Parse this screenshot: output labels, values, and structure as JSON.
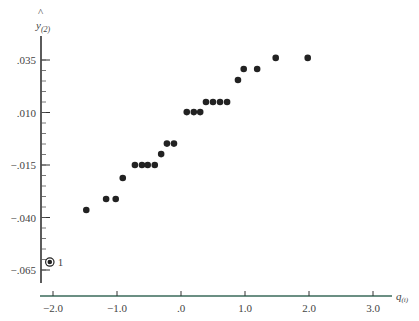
{
  "chart_data": {
    "type": "scatter",
    "title": "",
    "xlabel": "q(i)",
    "ylabel": "ŷ(2)",
    "xlim": [
      -2.2,
      3.3
    ],
    "ylim": [
      -0.069,
      0.043
    ],
    "grid": false,
    "legend": null,
    "x_ticks": [
      -2.0,
      -1.0,
      0.0,
      1.0,
      2.0,
      3.0
    ],
    "x_tick_labels": [
      "−2.0",
      "−1.0",
      ".0",
      "1.0",
      "2.0",
      "3.0"
    ],
    "y_ticks": [
      0.035,
      0.01,
      -0.015,
      -0.04,
      -0.065
    ],
    "y_tick_labels": [
      ".035",
      ".010",
      "−.015",
      "−.040",
      "−.065"
    ],
    "series": [
      {
        "name": "points",
        "x": [
          -1.48,
          -1.17,
          -1.02,
          -0.91,
          -0.72,
          -0.61,
          -0.52,
          -0.41,
          -0.31,
          -0.22,
          -0.11,
          0.09,
          0.2,
          0.3,
          0.39,
          0.5,
          0.61,
          0.72,
          0.89,
          0.98,
          1.19,
          1.48,
          1.98
        ],
        "y": [
          -0.0364,
          -0.0312,
          -0.0312,
          -0.0212,
          -0.015,
          -0.015,
          -0.015,
          -0.015,
          -0.0098,
          -0.0048,
          -0.0048,
          0.0102,
          0.0102,
          0.0102,
          0.015,
          0.015,
          0.015,
          0.015,
          0.0255,
          0.0307,
          0.0307,
          0.036,
          0.036
        ]
      }
    ],
    "annotations": [
      {
        "x": -2.05,
        "y": -0.0612,
        "label": "1",
        "marker": "circled-dot"
      }
    ]
  }
}
